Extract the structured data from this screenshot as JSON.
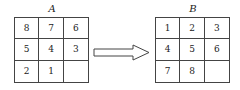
{
  "grid_a": {
    "label": "A",
    "cells": [
      "8",
      "7",
      "6",
      "5",
      "4",
      "3",
      "2",
      "1",
      ""
    ]
  },
  "grid_b": {
    "label": "B",
    "cells": [
      "1",
      "2",
      "3",
      "4",
      "5",
      "6",
      "7",
      "8",
      ""
    ]
  },
  "arrow": {
    "direction": "right",
    "icon": "right-arrow-icon"
  }
}
